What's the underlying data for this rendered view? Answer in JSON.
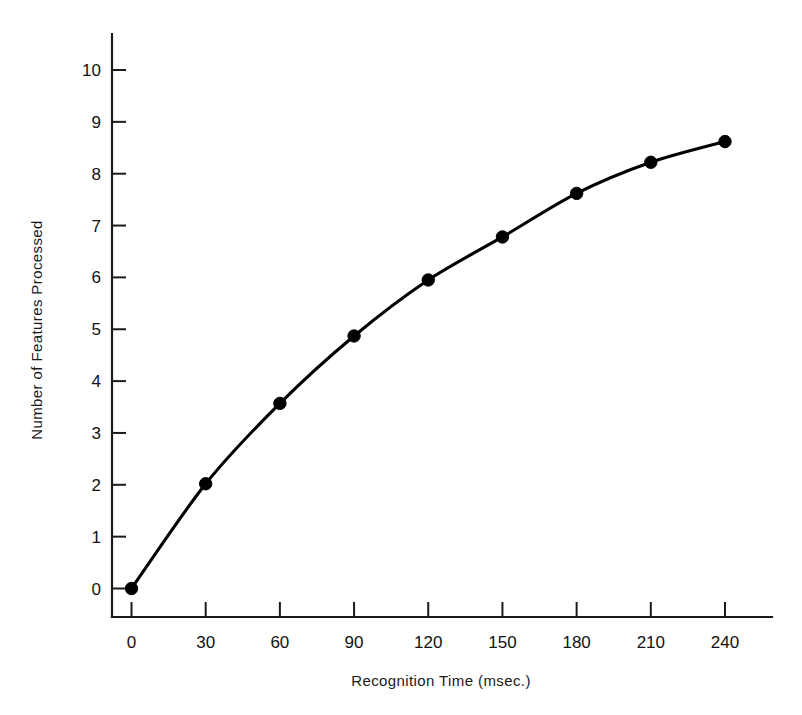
{
  "chart_data": {
    "type": "line",
    "title": "",
    "xlabel": "Recognition Time (msec.)",
    "ylabel": "Number of Features Processed",
    "x": [
      0,
      30,
      60,
      90,
      120,
      150,
      180,
      210,
      240
    ],
    "values": [
      0.0,
      2.02,
      3.57,
      4.87,
      5.95,
      6.78,
      7.62,
      8.22,
      8.62
    ],
    "series": [
      {
        "name": "Features processed",
        "values": [
          0.0,
          2.02,
          3.57,
          4.87,
          5.95,
          6.78,
          7.62,
          8.22,
          8.62
        ]
      }
    ],
    "xlim": [
      0,
      255
    ],
    "ylim": [
      0,
      10.5
    ],
    "xticks": [
      0,
      30,
      60,
      90,
      120,
      150,
      180,
      210,
      240
    ],
    "xtick_labels": [
      "0",
      "30",
      "60",
      "90",
      "120",
      "150",
      "180",
      "210",
      "240"
    ],
    "yticks": [
      0,
      1,
      2,
      3,
      4,
      5,
      6,
      7,
      8,
      9,
      10
    ],
    "ytick_labels": [
      "0",
      "1",
      "2",
      "3",
      "4",
      "5",
      "6",
      "7",
      "8",
      "9",
      "10"
    ],
    "grid": false,
    "legend": false,
    "legend_position": "none",
    "marker": "filled-circle",
    "line_color": "#000000",
    "marker_color": "#000000",
    "background_color": "#ffffff"
  }
}
